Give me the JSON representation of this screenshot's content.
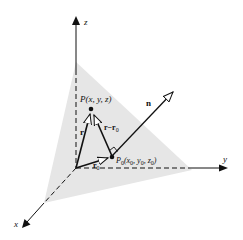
{
  "diagram": {
    "type": "3d-vector-plane",
    "axes": {
      "x_label": "x",
      "y_label": "y",
      "z_label": "z"
    },
    "points": {
      "P": {
        "label": "P(x, y, z)"
      },
      "P0": {
        "label_main": "P",
        "label_sub": "0",
        "label_args": "(x",
        "args": [
          "x",
          "y",
          "z"
        ],
        "arg_sub": "0"
      }
    },
    "vectors": {
      "normal": {
        "label": "n"
      },
      "r": {
        "label": "r"
      },
      "r0": {
        "label": "r",
        "sub": "0"
      },
      "r_minus_r0": {
        "label": "r−r",
        "sub": "0"
      }
    },
    "colors": {
      "plane": "#e6e6e6",
      "ink": "#111111",
      "background": "#ffffff"
    }
  }
}
